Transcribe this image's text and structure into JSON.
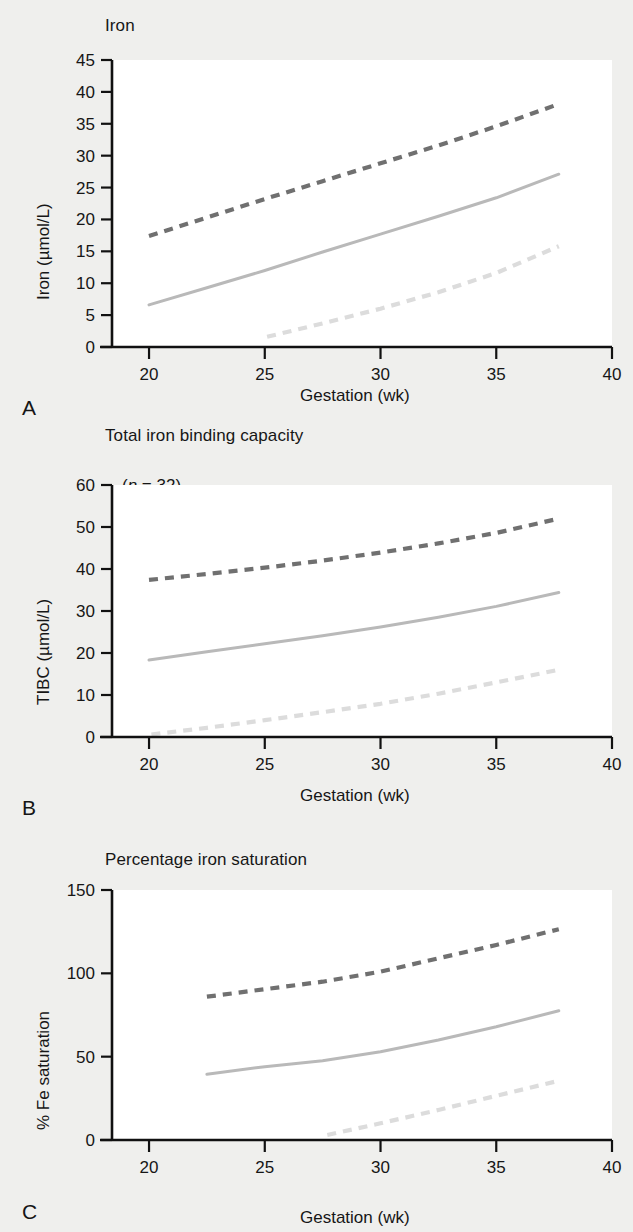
{
  "figure": {
    "background_color": "#efefed",
    "plot_background_color": "#ffffff",
    "axis_color": "#111111",
    "shared_xlabel": "Gestation (wk)",
    "panel_letters": [
      "A",
      "B",
      "C"
    ]
  },
  "colors": {
    "upper_limit_line": "#707070",
    "mean_line": "#b9b9b9",
    "lower_limit_line": "#dcdcdc"
  },
  "panels": [
    {
      "letter": "A",
      "title": "Iron",
      "n_prefix": "(",
      "n_italic": "n",
      "n_value": " = 33)",
      "ylabel": "Iron (µmol/L)",
      "xlabel": "Gestation (wk)",
      "yticks": [
        "0",
        "5",
        "10",
        "15",
        "20",
        "25",
        "30",
        "35",
        "40",
        "45"
      ],
      "xticks": [
        "20",
        "25",
        "30",
        "35",
        "40"
      ]
    },
    {
      "letter": "B",
      "title": "Total iron binding capacity",
      "n_prefix": "(",
      "n_italic": "n",
      "n_value": " = 32)",
      "ylabel": "TIBC (µmol/L)",
      "xlabel": "Gestation (wk)",
      "yticks": [
        "0",
        "10",
        "20",
        "30",
        "40",
        "50",
        "60"
      ],
      "xticks": [
        "20",
        "25",
        "30",
        "35",
        "40"
      ]
    },
    {
      "letter": "C",
      "title": "Percentage iron saturation",
      "n_prefix": "(",
      "n_italic": "n",
      "n_value": " = 32)",
      "ylabel": "% Fe saturation",
      "xlabel": "Gestation (wk)",
      "yticks": [
        "0",
        "50",
        "100",
        "150"
      ],
      "xticks": [
        "20",
        "25",
        "30",
        "35",
        "40"
      ]
    }
  ],
  "chart_data": [
    {
      "type": "line",
      "panel": "A",
      "title": "Iron",
      "annotation": "(n = 33)",
      "xlabel": "Gestation (wk)",
      "ylabel": "Iron (µmol/L)",
      "xlim": [
        18.4,
        40
      ],
      "ylim": [
        0,
        45
      ],
      "ytick_values": [
        0,
        5,
        10,
        15,
        20,
        25,
        30,
        35,
        40,
        45
      ],
      "xtick_values": [
        20,
        25,
        30,
        35,
        40
      ],
      "grid": false,
      "legend": "none",
      "series": [
        {
          "name": "Upper reference limit (97.5th centile)",
          "style": "dashed",
          "color": "#707070",
          "x": [
            20.0,
            22.5,
            25.0,
            27.5,
            30.0,
            32.5,
            35.0,
            37.7
          ],
          "y": [
            17.4,
            20.3,
            23.2,
            26.0,
            28.8,
            31.6,
            34.6,
            38.1
          ]
        },
        {
          "name": "Median",
          "style": "solid",
          "color": "#b9b9b9",
          "x": [
            20.0,
            22.5,
            25.0,
            27.5,
            30.0,
            32.5,
            35.0,
            37.7
          ],
          "y": [
            6.6,
            9.3,
            12.0,
            14.9,
            17.7,
            20.5,
            23.4,
            27.1
          ]
        },
        {
          "name": "Lower reference limit (2.5th centile)",
          "style": "dashed",
          "color": "#dcdcdc",
          "x": [
            25.1,
            27.5,
            30.0,
            32.5,
            35.0,
            37.7
          ],
          "y": [
            1.6,
            3.7,
            6.0,
            8.6,
            11.6,
            15.8
          ]
        }
      ]
    },
    {
      "type": "line",
      "panel": "B",
      "title": "Total iron binding capacity",
      "annotation": "(n = 32)",
      "xlabel": "Gestation (wk)",
      "ylabel": "TIBC (µmol/L)",
      "xlim": [
        18.4,
        40
      ],
      "ylim": [
        0,
        60
      ],
      "ytick_values": [
        0,
        10,
        20,
        30,
        40,
        50,
        60
      ],
      "xtick_values": [
        20,
        25,
        30,
        35,
        40
      ],
      "grid": false,
      "legend": "none",
      "series": [
        {
          "name": "Upper reference limit (97.5th centile)",
          "style": "dashed",
          "color": "#707070",
          "x": [
            20.0,
            22.5,
            25.0,
            27.5,
            30.0,
            32.5,
            35.0,
            37.7
          ],
          "y": [
            37.4,
            38.8,
            40.3,
            42.0,
            43.9,
            46.1,
            48.6,
            52.0
          ]
        },
        {
          "name": "Median",
          "style": "solid",
          "color": "#b9b9b9",
          "x": [
            20.0,
            22.5,
            25.0,
            27.5,
            30.0,
            32.5,
            35.0,
            37.7
          ],
          "y": [
            18.3,
            20.3,
            22.2,
            24.1,
            26.2,
            28.5,
            31.1,
            34.4
          ]
        },
        {
          "name": "Lower reference limit (2.5th centile)",
          "style": "dashed",
          "color": "#dcdcdc",
          "x": [
            20.1,
            22.5,
            25.0,
            27.5,
            30.0,
            32.5,
            35.0,
            37.7
          ],
          "y": [
            0.6,
            2.2,
            4.0,
            5.9,
            7.9,
            10.3,
            13.0,
            16.0
          ]
        }
      ]
    },
    {
      "type": "line",
      "panel": "C",
      "title": "Percentage iron saturation",
      "annotation": "(n = 32)",
      "xlabel": "Gestation (wk)",
      "ylabel": "% Fe saturation",
      "xlim": [
        18.4,
        40
      ],
      "ylim": [
        0,
        150
      ],
      "ytick_values": [
        0,
        50,
        100,
        150
      ],
      "xtick_values": [
        20,
        25,
        30,
        35,
        40
      ],
      "grid": false,
      "legend": "none",
      "series": [
        {
          "name": "Upper reference limit (97.5th centile)",
          "style": "dashed",
          "color": "#707070",
          "x": [
            22.5,
            25.0,
            27.5,
            30.0,
            32.5,
            35.0,
            37.7
          ],
          "y": [
            86.0,
            90.5,
            95.0,
            101.0,
            109.0,
            117.0,
            126.5
          ]
        },
        {
          "name": "Median",
          "style": "solid",
          "color": "#b9b9b9",
          "x": [
            22.5,
            25.0,
            27.5,
            30.0,
            32.5,
            35.0,
            37.7
          ],
          "y": [
            39.5,
            44.0,
            47.5,
            53.0,
            60.0,
            68.0,
            77.5
          ]
        },
        {
          "name": "Lower reference limit (2.5th centile)",
          "style": "dashed",
          "color": "#dcdcdc",
          "x": [
            27.7,
            30.0,
            32.5,
            35.0,
            37.7
          ],
          "y": [
            3.0,
            10.0,
            18.0,
            26.5,
            35.5
          ]
        }
      ]
    }
  ]
}
